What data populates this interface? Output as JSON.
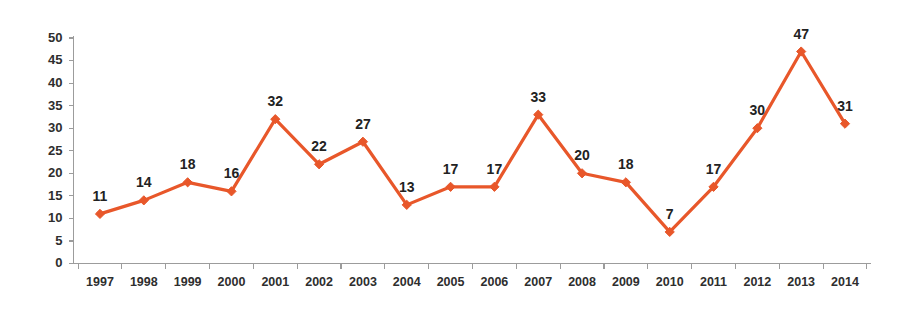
{
  "chart_data": {
    "type": "line",
    "title": "",
    "subtitle": "",
    "xlabel": "",
    "ylabel": "",
    "categories": [
      "1997",
      "1998",
      "1999",
      "2000",
      "2001",
      "2002",
      "2003",
      "2004",
      "2005",
      "2006",
      "2007",
      "2008",
      "2009",
      "2010",
      "2011",
      "2012",
      "2013",
      "2014"
    ],
    "values": [
      11,
      14,
      18,
      16,
      32,
      22,
      27,
      13,
      17,
      17,
      33,
      20,
      18,
      7,
      17,
      30,
      47,
      31
    ],
    "point_labels": [
      "11",
      "14",
      "18",
      "16",
      "32",
      "22",
      "27",
      "13",
      "17",
      "17",
      "33",
      "20",
      "18",
      "7",
      "17",
      "30",
      "47",
      "31"
    ],
    "ylim": [
      0,
      50
    ],
    "ytick_values": [
      0,
      5,
      10,
      15,
      20,
      25,
      30,
      35,
      40,
      45,
      50
    ],
    "ytick_labels": [
      "0",
      "5",
      "10",
      "15",
      "20",
      "25",
      "30",
      "35",
      "40",
      "45",
      "50"
    ],
    "grid": false,
    "legend": false,
    "legend_position": "none",
    "series_name": "",
    "data_labels_shown": true,
    "marker": "diamond"
  },
  "style": {
    "line_color": "#E8572A",
    "marker_color": "#E8572A",
    "axis_color": "#9C9C9C",
    "label_color": "#222222",
    "tick_label_color": "#2E2E2E",
    "background": "#FFFFFF"
  }
}
